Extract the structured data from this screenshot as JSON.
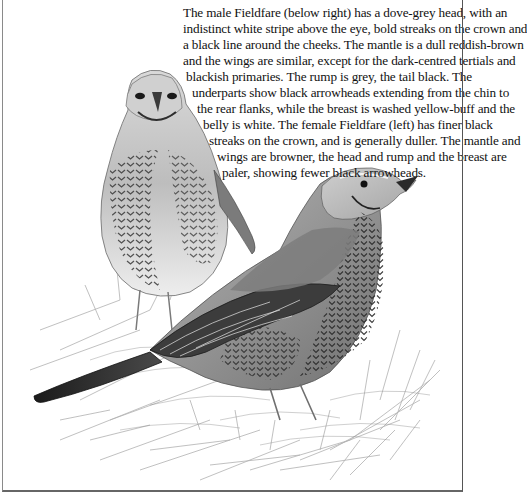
{
  "caption": {
    "lines": [
      "The male Fieldfare (below right) has a dove-grey head, with an",
      "indistinct white stripe above the eye, bold streaks on the crown and",
      "a black line around the cheeks. The mantle is a dull reddish-brown",
      "and the wings are similar, except for the dark-centred tertials and",
      " blackish primaries. The rump is grey, the tail black. The",
      "underparts show black arrowheads extending from the chin to",
      "the rear flanks, while the breast is washed yellow-buff and the",
      "belly is white. The female Fieldfare (left) has finer black",
      "streaks on the crown, and is generally duller. The mantle and",
      "wings are browner, the head and rump and the breast are",
      "paler, showing fewer black arrowheads."
    ]
  },
  "illustration": {
    "subject": "Fieldfare pair (female left, male right) on grass",
    "colors": {
      "ink": "#1a1a1a",
      "mid_grey": "#8c8c8c",
      "light_grey": "#cfcfcf",
      "grass": "#b5b5b5"
    }
  }
}
